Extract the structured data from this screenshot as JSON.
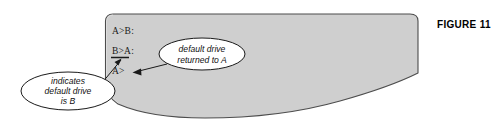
{
  "figure": {
    "label": "FIGURE 11",
    "label_x": 437,
    "label_y": 19
  },
  "screen": {
    "fill_color": "#cfcfcf",
    "stroke_color": "#4d4d4d",
    "prompt_lines": [
      {
        "text": "A>B:",
        "x": 112,
        "y": 34,
        "underlined": false
      },
      {
        "text": "B>A:",
        "x": 112,
        "y": 54,
        "underlined": true
      },
      {
        "text": "A>",
        "x": 112,
        "y": 74,
        "underlined": false
      }
    ]
  },
  "callouts": [
    {
      "name": "left-callout",
      "cx": 68,
      "cy": 91,
      "rx": 47,
      "ry": 19,
      "lines": [
        {
          "text": "indicates",
          "dy": -7
        },
        {
          "text": "default drive",
          "dy": 3
        },
        {
          "text": "is B",
          "dy": 13
        }
      ]
    },
    {
      "name": "right-callout",
      "cx": 202,
      "cy": 54,
      "rx": 43,
      "ry": 16,
      "lines": [
        {
          "text": "default drive",
          "dy": -2
        },
        {
          "text": "returned to A",
          "dy": 9
        }
      ]
    }
  ],
  "arrows": [
    {
      "name": "left-callout-arrow",
      "from_x": 104,
      "from_y": 80,
      "to_x": 120,
      "to_y": 59
    },
    {
      "name": "right-callout-arrow",
      "from_x": 166,
      "from_y": 64,
      "to_x": 133,
      "to_y": 72
    }
  ]
}
